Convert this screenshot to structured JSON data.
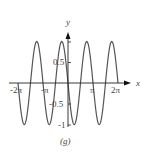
{
  "chart_data": {
    "type": "line",
    "title": "",
    "caption": "(g)",
    "xlabel": "x",
    "ylabel": "y",
    "xlim": [
      -6.6,
      8.5
    ],
    "ylim": [
      -1.1,
      1.6
    ],
    "grid": false,
    "legend": null,
    "function": "y = -sin(2x)",
    "domain": [
      -6.2832,
      6.2832
    ],
    "x_ticks": [
      {
        "value": -6.2832,
        "label": "-2π"
      },
      {
        "value": -3.1416,
        "label": "-π"
      },
      {
        "value": 3.1416,
        "label": "π"
      },
      {
        "value": 6.2832,
        "label": "2π"
      }
    ],
    "y_ticks": [
      {
        "value": 1,
        "label": "1"
      },
      {
        "value": 0.5,
        "label": "0.5"
      },
      {
        "value": -0.5,
        "label": "-0.5"
      },
      {
        "value": -1,
        "label": "-1"
      }
    ],
    "series": [
      {
        "name": "y = -sin(2x)",
        "color": "#555555",
        "x": [
          -6.2832,
          -5.4978,
          -4.7124,
          -3.927,
          -3.1416,
          -2.3562,
          -1.5708,
          -0.7854,
          0,
          0.7854,
          1.5708,
          2.3562,
          3.1416,
          3.927,
          4.7124,
          5.4978,
          6.2832
        ],
        "y": [
          0,
          -1,
          0,
          1,
          0,
          -1,
          0,
          1,
          0,
          -1,
          0,
          1,
          0,
          -1,
          0,
          1,
          0
        ]
      }
    ]
  },
  "labels": {
    "x_axis": "x",
    "y_axis": "y",
    "x_neg_2pi": "-2π",
    "x_neg_pi": "-π",
    "x_pi": "π",
    "x_2pi": "2π",
    "y_1": "1",
    "y_05": "0.5",
    "y_neg05": "-0.5",
    "y_neg1": "-1",
    "caption": "(g)"
  },
  "colors": {
    "curve": "#555555",
    "axis": "#222222"
  }
}
